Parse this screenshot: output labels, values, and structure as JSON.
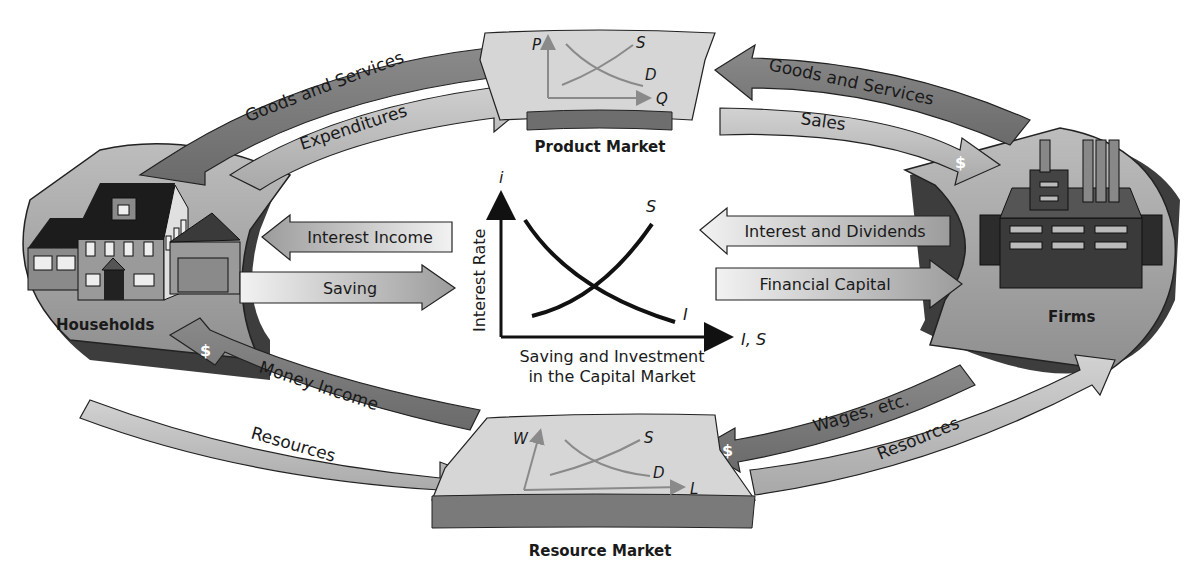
{
  "diagram": {
    "colors": {
      "ring": "#a9a9a9",
      "ring_dark": "#5a5a5a",
      "arrow_dark": "#7a7a7a",
      "arrow_light": "#c8c8c8",
      "market_plate": "#d6d6d6",
      "ink": "#1a1a1a"
    },
    "nodes": {
      "households": {
        "label": "Households"
      },
      "firms": {
        "label": "Firms"
      },
      "product_market": {
        "label": "Product Market",
        "y_axis": "P",
        "x_axis": "Q",
        "supply": "S",
        "demand": "D"
      },
      "resource_market": {
        "label": "Resource Market",
        "y_axis": "W",
        "x_axis": "L",
        "supply": "S",
        "demand": "D"
      }
    },
    "flows": {
      "top_left_outer": "Goods and Services",
      "top_left_inner": "Expenditures",
      "top_right_outer": "Goods and Services",
      "top_right_inner": "Sales",
      "bottom_left_inner": "Money Income",
      "bottom_left_outer": "Resources",
      "bottom_right_inner": "Wages, etc.",
      "bottom_right_outer": "Resources",
      "interest_income": "Interest Income",
      "saving": "Saving",
      "interest_dividends": "Interest and Dividends",
      "financial_capital": "Financial Capital",
      "dollar": "$"
    },
    "capital_market": {
      "y_axis_symbol": "i",
      "y_axis_label": "Interest Rate",
      "x_axis_symbol": "I, S",
      "supply_label": "S",
      "investment_label": "I",
      "caption_line1": "Saving and Investment",
      "caption_line2": "in the Capital Market"
    }
  }
}
